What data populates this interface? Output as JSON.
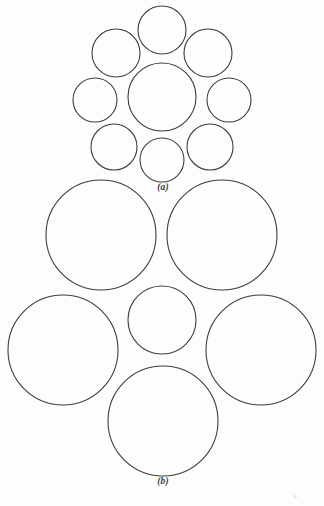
{
  "figure": {
    "background_color": "#fdfdfc",
    "stroke_color": "#3d3d3d",
    "stroke_width": 1.1,
    "fill_color": "none",
    "width": 324,
    "height": 506
  },
  "panels": [
    {
      "id": "a",
      "caption": "(a)",
      "caption_x": 163,
      "caption_y": 183,
      "description": "Nine-circle packing: one central circle ringed by eight equal smaller circles"
    },
    {
      "id": "b",
      "caption": "(b)",
      "caption_x": 163,
      "caption_y": 477,
      "description": "Six-circle packing: one small central circle ringed by five large circles"
    }
  ],
  "chart_data": {
    "type": "scatter",
    "xlabel": "",
    "ylabel": "",
    "xlim": [
      0,
      324
    ],
    "ylim": [
      0,
      506
    ],
    "grid": false,
    "legend": "none",
    "annotations": [
      "(a)",
      "(b)"
    ],
    "series": [
      {
        "name": "panel-a-circles",
        "circles": [
          {
            "label": "a-top",
            "cx": 162,
            "cy": 30,
            "r": 24
          },
          {
            "label": "a-upper-left",
            "cx": 116,
            "cy": 53,
            "r": 24
          },
          {
            "label": "a-upper-right",
            "cx": 208,
            "cy": 53,
            "r": 24
          },
          {
            "label": "a-center",
            "cx": 162,
            "cy": 97,
            "r": 34
          },
          {
            "label": "a-left",
            "cx": 95,
            "cy": 100,
            "r": 22
          },
          {
            "label": "a-right",
            "cx": 229,
            "cy": 100,
            "r": 22
          },
          {
            "label": "a-lower-left",
            "cx": 114,
            "cy": 147,
            "r": 23
          },
          {
            "label": "a-lower-right",
            "cx": 210,
            "cy": 147,
            "r": 23
          },
          {
            "label": "a-bottom",
            "cx": 162,
            "cy": 160,
            "r": 22
          }
        ]
      },
      {
        "name": "panel-b-circles",
        "circles": [
          {
            "label": "b-upper-left",
            "cx": 101,
            "cy": 235,
            "r": 55
          },
          {
            "label": "b-upper-right",
            "cx": 222,
            "cy": 235,
            "r": 55
          },
          {
            "label": "b-center",
            "cx": 162,
            "cy": 320,
            "r": 34
          },
          {
            "label": "b-middle-left",
            "cx": 63,
            "cy": 350,
            "r": 55
          },
          {
            "label": "b-middle-right",
            "cx": 261,
            "cy": 350,
            "r": 55
          },
          {
            "label": "b-bottom",
            "cx": 163,
            "cy": 421,
            "r": 55
          }
        ]
      }
    ]
  }
}
